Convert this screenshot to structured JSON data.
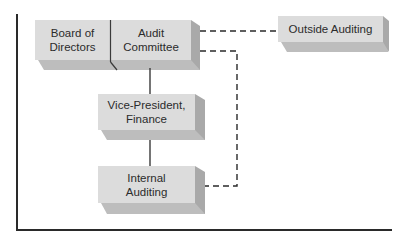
{
  "diagram": {
    "type": "organization-chart",
    "nodes": {
      "board": {
        "label_line1": "Board of",
        "label_line2": "Directors"
      },
      "audit_committee": {
        "label_line1": "Audit",
        "label_line2": "Committee"
      },
      "outside_auditing": {
        "label_line1": "Outside Auditing"
      },
      "vp_finance": {
        "label_line1": "Vice-President,",
        "label_line2": "Finance"
      },
      "internal_auditing": {
        "label_line1": "Internal",
        "label_line2": "Auditing"
      }
    },
    "edges": [
      {
        "from": "audit_committee",
        "to": "vp_finance",
        "style": "solid"
      },
      {
        "from": "vp_finance",
        "to": "internal_auditing",
        "style": "solid"
      },
      {
        "from": "audit_committee",
        "to": "outside_auditing",
        "style": "dashed"
      },
      {
        "from": "audit_committee",
        "to": "internal_auditing",
        "style": "dashed"
      }
    ],
    "colors": {
      "box_face": "#dcdcdc",
      "box_side": "#a9a9a9",
      "box_bottom": "#bdbdbd",
      "line": "#2a2a2a",
      "text": "#2b2b2b"
    }
  }
}
